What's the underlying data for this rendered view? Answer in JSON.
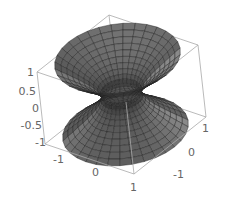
{
  "chart_data": {
    "type": "surface3d",
    "title": "",
    "surface": "hyperboloid of one sheet",
    "equation": "x^2 + y^2 - z^2 = r0^2 (throat radius ~0.35)",
    "parametric": {
      "u": "angle 0..2pi",
      "v": "z -1..1",
      "throat_radius": 0.35,
      "max_radius": 1.1
    },
    "mesh": {
      "u_lines": 32,
      "v_lines": 20
    },
    "x_axis": {
      "label": "",
      "ticks": [
        "-1",
        "0",
        "1"
      ],
      "range": [
        -1.2,
        1.2
      ]
    },
    "y_axis": {
      "label": "",
      "ticks": [
        "-1",
        "0",
        "1"
      ],
      "range": [
        -1.2,
        1.2
      ]
    },
    "z_axis": {
      "label": "",
      "ticks": [
        "-1",
        "-0.5",
        "0",
        "0.5",
        "1"
      ],
      "range": [
        -1,
        1
      ]
    },
    "box": true,
    "grid": false,
    "legend": null,
    "surface_color": "#8a8a8a",
    "mesh_color": "#222222",
    "box_color": "#a8a8a8",
    "tick_color": "#666666"
  },
  "labels": {
    "z_ticks": [
      {
        "text": "1",
        "x": 30,
        "y": 76
      },
      {
        "text": "0.5",
        "x": 30,
        "y": 95
      },
      {
        "text": "0",
        "x": 35,
        "y": 112
      },
      {
        "text": "-0.5",
        "x": 38,
        "y": 129
      },
      {
        "text": "-1",
        "x": 44,
        "y": 146
      }
    ],
    "x_ticks": [
      {
        "text": "-1",
        "x": 56,
        "y": 161
      },
      {
        "text": "0",
        "x": 94,
        "y": 174
      },
      {
        "text": "1",
        "x": 131,
        "y": 190
      }
    ],
    "y_ticks": [
      {
        "text": "-1",
        "x": 177,
        "y": 180
      },
      {
        "text": "0",
        "x": 189,
        "y": 156
      },
      {
        "text": "1",
        "x": 204,
        "y": 131
      }
    ]
  }
}
